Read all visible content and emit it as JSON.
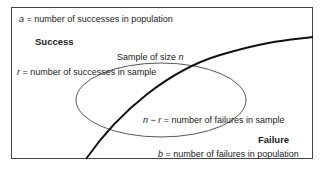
{
  "diagram": {
    "labels": {
      "population_successes": {
        "var": "a",
        "text": " = number of successes in population"
      },
      "success_region": "Success",
      "sample_title_prefix": "Sample of size ",
      "sample_title_var": "n",
      "sample_successes": {
        "var": "r",
        "text": " = number of successes in sample"
      },
      "sample_failures": {
        "var_n": "n",
        "minus": " − ",
        "var_r": "r",
        "text": " = number of failures in sample"
      },
      "failure_region": "Failure",
      "population_failures": {
        "var": "b",
        "text": " = number of failures in population"
      }
    },
    "shapes": {
      "population_box": "rectangle",
      "sample": "ellipse",
      "divider": "curve separating Success and Failure"
    },
    "colors": {
      "line": "#222222",
      "background": "#ffffff"
    }
  }
}
